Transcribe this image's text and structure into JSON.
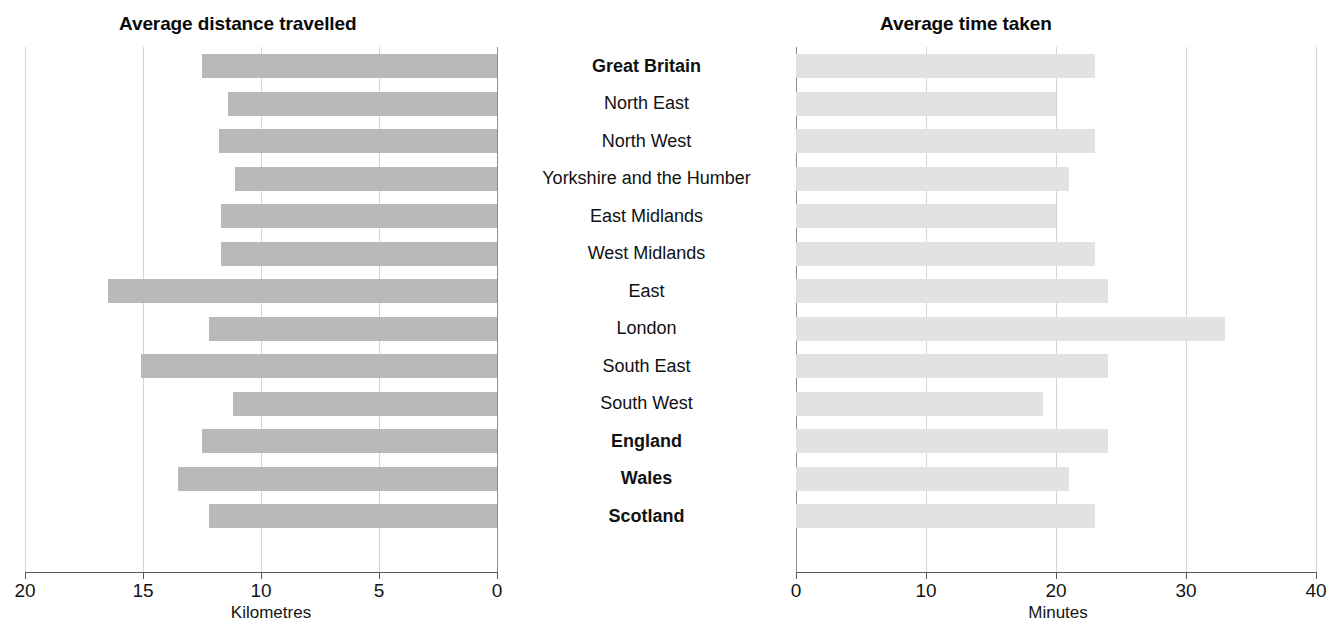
{
  "chart_data": [
    {
      "type": "bar",
      "orientation": "horizontal",
      "title": "Average distance travelled",
      "xlabel": "Kilometres",
      "ylabel": "",
      "xlim": [
        20,
        0
      ],
      "reversed": true,
      "ticks": [
        20,
        15,
        10,
        5,
        0
      ],
      "grid": true,
      "bar_color": "#b9b9b9",
      "categories": [
        "Great Britain",
        "North East",
        "North West",
        "Yorkshire and the Humber",
        "East Midlands",
        "West Midlands",
        "East",
        "London",
        "South East",
        "South West",
        "England",
        "Wales",
        "Scotland"
      ],
      "values": [
        12.5,
        11.4,
        11.8,
        11.1,
        11.7,
        11.7,
        16.5,
        12.2,
        15.1,
        11.2,
        12.5,
        13.5,
        12.2
      ]
    },
    {
      "type": "bar",
      "orientation": "horizontal",
      "title": "Average time taken",
      "xlabel": "Minutes",
      "ylabel": "",
      "xlim": [
        0,
        40
      ],
      "reversed": false,
      "ticks": [
        0,
        10,
        20,
        30,
        40
      ],
      "grid": true,
      "bar_color": "#e2e2e2",
      "categories": [
        "Great Britain",
        "North East",
        "North West",
        "Yorkshire and the Humber",
        "East Midlands",
        "West Midlands",
        "East",
        "London",
        "South East",
        "South West",
        "England",
        "Wales",
        "Scotland"
      ],
      "values": [
        23,
        20,
        23,
        21,
        20,
        23,
        24,
        33,
        24,
        19,
        24,
        21,
        23
      ]
    }
  ],
  "titles": {
    "left": "Average distance travelled",
    "right": "Average time taken"
  },
  "axes": {
    "left": {
      "caption": "Kilometres",
      "ticks": [
        "20",
        "15",
        "10",
        "5",
        "0"
      ]
    },
    "right": {
      "caption": "Minutes",
      "ticks": [
        "0",
        "10",
        "20",
        "30",
        "40"
      ]
    }
  },
  "categories": [
    {
      "label": "Great Britain",
      "bold": true
    },
    {
      "label": "North East",
      "bold": false
    },
    {
      "label": "North West",
      "bold": false
    },
    {
      "label": "Yorkshire and the Humber",
      "bold": false
    },
    {
      "label": "East Midlands",
      "bold": false
    },
    {
      "label": "West Midlands",
      "bold": false
    },
    {
      "label": "East",
      "bold": false
    },
    {
      "label": "London",
      "bold": false
    },
    {
      "label": "South East",
      "bold": false
    },
    {
      "label": "South West",
      "bold": false
    },
    {
      "label": "England",
      "bold": true
    },
    {
      "label": "Wales",
      "bold": true
    },
    {
      "label": "Scotland",
      "bold": true
    }
  ]
}
